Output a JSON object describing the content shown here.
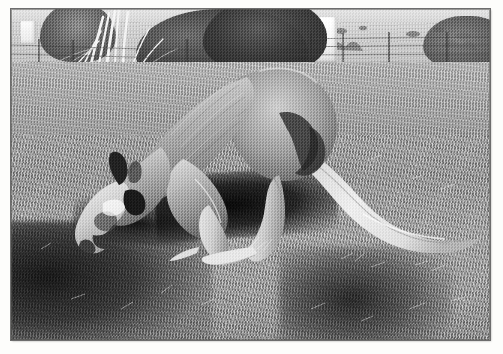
{
  "image": {
    "title": "Grazing kangaroo",
    "medium": "black-and-white photograph",
    "subject": "kangaroo",
    "alt_text": "A kangaroo bends forward on all fours grazing on dry grass in a fenced paddock, with bare trees and a distant hillside behind it.",
    "border_color": "#ffffff",
    "frame_line_color": "#5a5a56"
  },
  "palette": {
    "paper_white": "#fdfdfb",
    "highlight": "#f3f3ee",
    "light_grey": "#cfcfc6",
    "mid_grey": "#a7a79d",
    "dark_grey": "#6e6e66",
    "shadow_black": "#16160f"
  },
  "scene": {
    "background": {
      "sky_label": "overcast sky strip",
      "far_field_label": "distant hillside paddock",
      "tree_label": "eucalyptus trees",
      "bare_tree_label": "bare white-trunked tree",
      "white_structure_label": "white building wall",
      "fence_label": "wire fence with posts"
    },
    "midground": {
      "field_label": "dry grass paddock"
    },
    "foreground": {
      "ground_label": "dry grass and dirt",
      "shadow_left_label": "deep shadow at left",
      "shadow_right_label": "photographer shadow at lower right",
      "body_shadow_label": "kangaroo cast shadow"
    },
    "animal": {
      "label": "kangaroo",
      "pose": "bent forward, grazing",
      "parts": {
        "head": "head lowered to ground",
        "ear": "dark erect ear",
        "eye": "dark eye patch",
        "muzzle": "pale muzzle",
        "neck": "neck",
        "back": "arched back",
        "haunch": "rear haunch",
        "forelimb": "foreleg resting on ground",
        "hindleg": "hind leg planted",
        "foot": "long hind foot",
        "tail": "long thick tail extending right"
      }
    }
  }
}
